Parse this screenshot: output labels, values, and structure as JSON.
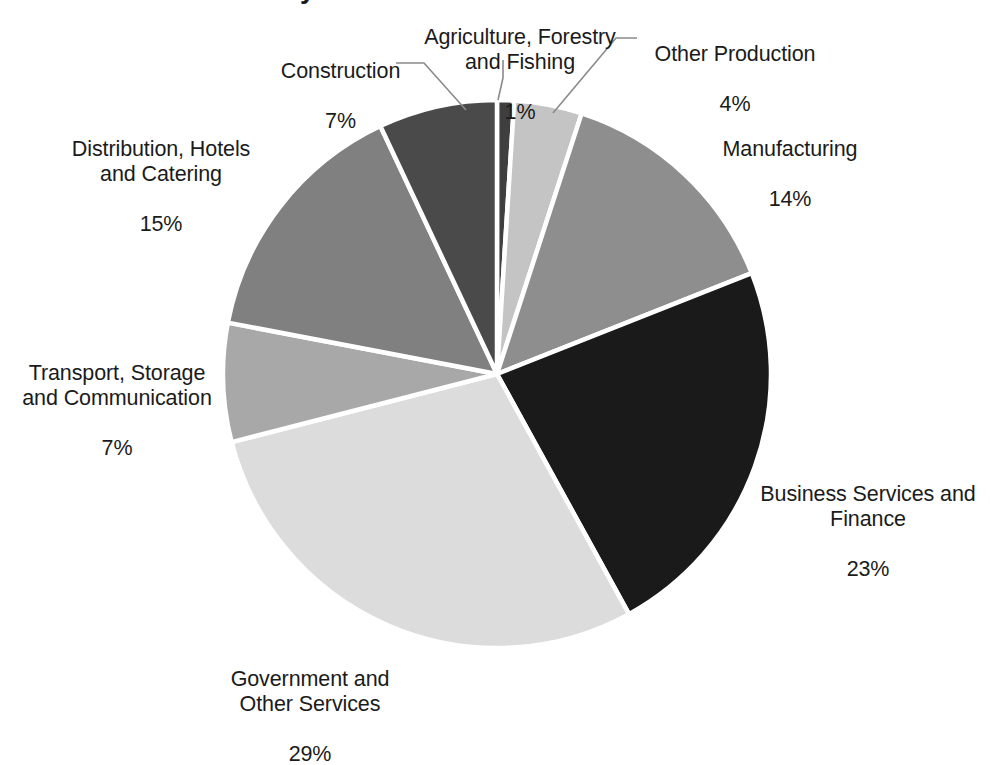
{
  "chart_data": {
    "type": "pie",
    "title": "",
    "title_cut_off_fragment": "y",
    "xlabel": "",
    "ylabel": "",
    "legend_position": "none",
    "grid": false,
    "value_suffix": "%",
    "start_angle_deg": 0,
    "direction": "clockwise",
    "categories": [
      "Agriculture, Forestry and Fishing",
      "Other Production",
      "Manufacturing",
      "Business Services and Finance",
      "Government and Other Services",
      "Transport, Storage and Communication",
      "Distribution, Hotels and Catering",
      "Construction"
    ],
    "values": [
      1,
      4,
      14,
      23,
      29,
      7,
      15,
      7
    ],
    "colors": [
      "#3f3f3f",
      "#c4c4c4",
      "#8e8e8e",
      "#1a1a1a",
      "#dcdcdc",
      "#a8a8a8",
      "#808080",
      "#4a4a4a"
    ],
    "slice_separator_color": "#ffffff",
    "background_color": "#ffffff"
  },
  "labels": {
    "construction": {
      "name": "Construction",
      "value": "7%"
    },
    "agriculture": {
      "name": "Agriculture, Forestry\nand Fishing",
      "value": "1%"
    },
    "other_production": {
      "name": "Other Production",
      "value": "4%"
    },
    "manufacturing": {
      "name": "Manufacturing",
      "value": "14%"
    },
    "business": {
      "name": "Business Services and\nFinance",
      "value": "23%"
    },
    "government": {
      "name": "Government and\nOther Services",
      "value": "29%"
    },
    "transport": {
      "name": "Transport, Storage\nand Communication",
      "value": "7%"
    },
    "distribution": {
      "name": "Distribution, Hotels\nand Catering",
      "value": "15%"
    }
  }
}
